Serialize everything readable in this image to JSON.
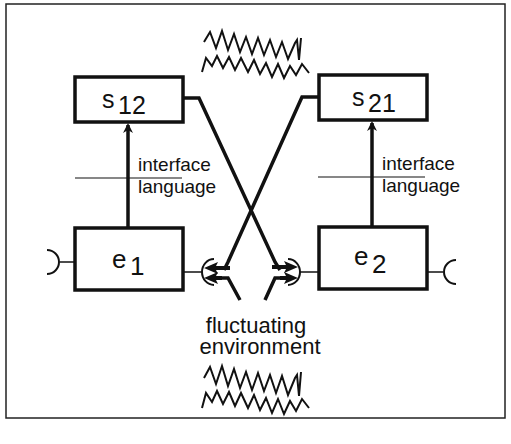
{
  "diagram": {
    "boxes": {
      "s12": {
        "base": "s",
        "sub": "12"
      },
      "s21": {
        "base": "s",
        "sub": "21"
      },
      "e1": {
        "base": "e",
        "sub": "1"
      },
      "e2": {
        "base": "e",
        "sub": "2"
      }
    },
    "labels": {
      "left_interface_line1": "interface",
      "left_interface_line2": "language",
      "right_interface_line1": "interface",
      "right_interface_line2": "language",
      "env_line1": "fluctuating",
      "env_line2": "environment"
    },
    "icons": {
      "top_noise": "zigzag-noise-icon",
      "bottom_noise": "zigzag-noise-icon"
    },
    "colors": {
      "stroke": "#111111",
      "background": "#ffffff"
    }
  }
}
